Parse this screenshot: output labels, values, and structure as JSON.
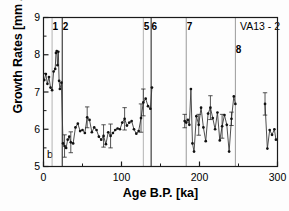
{
  "figure": {
    "panel_letter": "b",
    "sample_id": "VA13 - 2"
  },
  "chart_data": {
    "type": "line",
    "title": "",
    "xlabel": "Age B.P. [ka]",
    "ylabel": "Growth Rates [mm / Ma]",
    "xlim": [
      0,
      300
    ],
    "ylim": [
      5,
      9
    ],
    "xticks": [
      0,
      100,
      200,
      300
    ],
    "xticks_minor": [
      50,
      150,
      250
    ],
    "yticks": [
      5,
      6,
      7,
      8,
      9
    ],
    "yticks_minor": [
      5.5,
      6.5,
      7.5,
      8.5
    ],
    "grid": false,
    "legend": "none",
    "marker": "filled-circle",
    "error_bars": "vertical",
    "annotations": [
      {
        "label": "b",
        "position": "bottom-left-inside"
      },
      {
        "label": "VA13 - 2",
        "position": "top-right-inside"
      }
    ],
    "stage_markers": [
      {
        "label": "1",
        "x": 11,
        "color": "#b4b4b4",
        "label_x": 9,
        "label_y": 22
      },
      {
        "label": "2",
        "x": 24,
        "color": "#1a1a1a",
        "label_x": 22,
        "label_y": 22
      },
      {
        "label": "5",
        "x": 128,
        "color": "#b4b4b4",
        "label_x": 126,
        "label_y": 22
      },
      {
        "label": "6",
        "x": 138,
        "color": "#1a1a1a",
        "label_x": 136,
        "label_y": 22
      },
      {
        "label": "7",
        "x": 183,
        "color": "#9a9a9a",
        "label_x": 181,
        "label_y": 22
      },
      {
        "label": "8",
        "x": 246,
        "color": "#9a9a9a",
        "label_x": 244,
        "label_y": 45
      }
    ],
    "series": [
      {
        "name": "VA13-2 growth rate",
        "x": [
          1,
          3,
          5,
          7,
          9,
          11,
          13,
          15,
          16,
          17,
          18,
          19,
          20,
          21,
          23,
          25,
          27,
          29,
          31,
          33,
          35,
          38,
          41,
          44,
          47,
          50,
          53,
          56,
          59,
          62,
          65,
          68,
          71,
          74,
          77,
          80,
          83,
          86,
          89,
          92,
          95,
          98,
          101,
          104,
          107,
          110,
          113,
          116,
          119,
          122,
          125,
          128,
          131,
          134,
          137,
          139,
          181,
          183,
          185,
          187,
          189,
          191,
          193,
          196,
          199,
          202,
          205,
          208,
          211,
          214,
          217,
          220,
          223,
          226,
          229,
          232,
          235,
          238,
          241,
          244,
          246,
          284,
          287,
          290,
          293,
          296,
          298
        ],
        "y": [
          7.32,
          7.48,
          7.22,
          7.4,
          7.12,
          7.05,
          7.55,
          7.62,
          8.05,
          8.1,
          7.72,
          8.08,
          7.3,
          7.08,
          7.25,
          5.62,
          5.55,
          5.5,
          5.72,
          5.8,
          5.65,
          5.62,
          6.05,
          6.15,
          5.95,
          5.98,
          5.9,
          6.32,
          6.25,
          5.92,
          6.05,
          5.98,
          5.8,
          5.72,
          5.82,
          5.6,
          5.92,
          5.82,
          5.9,
          5.98,
          6.02,
          6.0,
          6.18,
          6.28,
          6.1,
          6.18,
          6.22,
          6.0,
          5.88,
          5.95,
          6.3,
          6.72,
          6.82,
          6.62,
          6.55,
          7.12,
          6.22,
          6.18,
          6.25,
          6.12,
          7.08,
          5.62,
          5.4,
          6.35,
          6.12,
          6.58,
          6.05,
          5.68,
          6.42,
          6.58,
          6.3,
          6.0,
          6.45,
          5.7,
          6.08,
          6.38,
          6.12,
          5.4,
          6.28,
          6.88,
          6.68,
          6.68,
          5.48,
          5.98,
          5.85,
          6.0,
          5.72
        ],
        "yerr": [
          0,
          0,
          0,
          0,
          0,
          0,
          0,
          0,
          0,
          0,
          0,
          0,
          0,
          0,
          0,
          0,
          0.3,
          0,
          0,
          0,
          0.28,
          0,
          0,
          0,
          0,
          0,
          0,
          0.28,
          0,
          0,
          0,
          0,
          0,
          0,
          0.3,
          0,
          0,
          0.32,
          0,
          0,
          0,
          0,
          0,
          0.3,
          0,
          0,
          0,
          0,
          0,
          0,
          0.38,
          0.36,
          0,
          0,
          0,
          0,
          0.18,
          0,
          0,
          0,
          0,
          0,
          0,
          0,
          0.28,
          0,
          0,
          0,
          0,
          0.32,
          0,
          0,
          0,
          0,
          0.32,
          0,
          0,
          0,
          0.18,
          0,
          0,
          0.3,
          0,
          0,
          0
        ]
      }
    ],
    "data_gaps": [
      [
        139,
        181
      ],
      [
        246,
        284
      ]
    ]
  }
}
